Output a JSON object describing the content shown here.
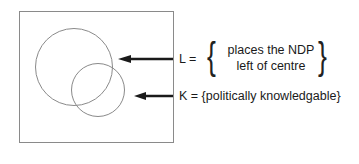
{
  "diagram": {
    "type": "venn",
    "sets": [
      {
        "id": "L",
        "label": "L =",
        "description_lines": [
          "places the NDP",
          "left of centre"
        ]
      },
      {
        "id": "K",
        "label": "K = {politically knowledgable}"
      }
    ],
    "colors": {
      "stroke": "#8a8a8a",
      "arrow": "#1a1a1a",
      "text": "#1a1a1a"
    }
  }
}
